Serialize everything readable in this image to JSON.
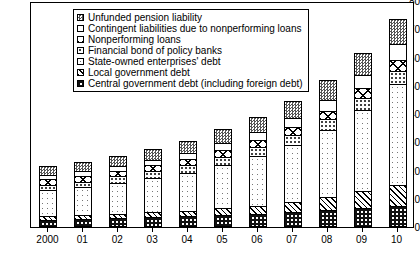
{
  "chart_data": {
    "type": "bar",
    "stacked": true,
    "title": "",
    "xlabel": "",
    "ylabel": "",
    "ylim": [
      0,
      80
    ],
    "yticks": [
      0,
      10,
      20,
      30,
      40,
      50,
      60,
      70,
      80
    ],
    "grid": false,
    "legend_position": "top-left-inside",
    "categories": [
      "2000",
      "01",
      "02",
      "03",
      "04",
      "05",
      "06",
      "07",
      "08",
      "09",
      "10"
    ],
    "series": [
      {
        "name": "Central government debt (including foreign debt)",
        "pattern": "p-central",
        "values": [
          2.6,
          2.8,
          3.2,
          3.5,
          3.8,
          4.2,
          4.7,
          5.4,
          6.0,
          6.6,
          7.3
        ]
      },
      {
        "name": "Local government debt",
        "pattern": "p-local",
        "values": [
          1.2,
          1.3,
          1.5,
          1.7,
          2.0,
          2.4,
          2.9,
          3.6,
          4.6,
          6.0,
          7.7
        ]
      },
      {
        "name": "State-owned enterprises' debt",
        "pattern": "p-soe",
        "values": [
          9.4,
          10.0,
          11.0,
          12.1,
          13.4,
          15.3,
          17.4,
          20.0,
          23.6,
          28.8,
          35.5
        ]
      },
      {
        "name": "Financial bond of policy banks",
        "pattern": "p-fbond",
        "values": [
          1.8,
          2.0,
          2.2,
          2.4,
          2.6,
          2.9,
          3.2,
          3.5,
          3.9,
          4.3,
          4.8
        ]
      },
      {
        "name": "Nonperforming loans",
        "pattern": "p-npl",
        "values": [
          1.9,
          1.9,
          2.0,
          2.1,
          2.2,
          2.4,
          2.6,
          2.8,
          3.1,
          3.4,
          3.8
        ]
      },
      {
        "name": "Contingent liabilities due to nonperforming loans",
        "pattern": "p-cont",
        "values": [
          1.6,
          1.7,
          1.8,
          2.0,
          2.2,
          2.5,
          2.8,
          3.3,
          3.9,
          4.6,
          5.6
        ]
      },
      {
        "name": "Unfunded pension liability",
        "pattern": "p-pension",
        "values": [
          3.0,
          3.3,
          3.6,
          4.0,
          4.4,
          4.9,
          5.5,
          6.2,
          7.0,
          7.9,
          8.8
        ]
      }
    ],
    "totals": [
      21.5,
      23.0,
      25.3,
      27.8,
      30.6,
      34.6,
      39.1,
      44.8,
      52.1,
      61.6,
      73.5
    ]
  },
  "legend": {
    "items": [
      {
        "label": "Unfunded pension liability",
        "swatch": "p-pension"
      },
      {
        "label": "Contingent liabilities due to nonperforming loans",
        "swatch": "p-cont"
      },
      {
        "label": "Nonperforming loans",
        "swatch": "p-npl"
      },
      {
        "label": "Financial bond of policy banks",
        "swatch": "p-fbond"
      },
      {
        "label": "State-owned enterprises' debt",
        "swatch": "p-soe"
      },
      {
        "label": "Local government debt",
        "swatch": "p-local"
      },
      {
        "label": "Central government debt (including foreign debt)",
        "swatch": "p-central"
      }
    ]
  }
}
